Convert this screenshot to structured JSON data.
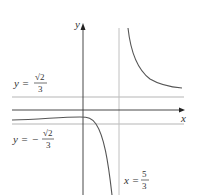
{
  "figure": {
    "type": "function-graph",
    "axes": {
      "x_label": "x",
      "y_label": "y"
    },
    "asymptotes": {
      "horizontal_upper": {
        "lhs": "y =",
        "numerator": "√2",
        "denominator": "3",
        "sign": ""
      },
      "horizontal_lower": {
        "lhs": "y =",
        "numerator": "√2",
        "denominator": "3",
        "sign": "−"
      },
      "vertical": {
        "lhs": "x =",
        "numerator": "5",
        "denominator": "3"
      }
    },
    "colors": {
      "axis": "#333333",
      "asymptote": "#b0b0b0",
      "curve": "#555555",
      "text": "#333333"
    }
  }
}
